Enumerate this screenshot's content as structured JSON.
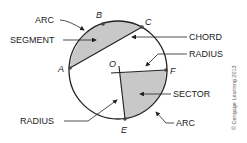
{
  "diagram": {
    "labels": {
      "arc_top": "ARC",
      "segment": "SEGMENT",
      "chord": "CHORD",
      "radius_right": "RADIUS",
      "sector": "SECTOR",
      "radius_left": "RADIUS",
      "arc_bottom": "ARC"
    },
    "points": {
      "A": "A",
      "B": "B",
      "C": "C",
      "O": "O",
      "F": "F",
      "E": "E"
    },
    "credit": "© Cengage Learning 2013",
    "colors": {
      "fill": "#c8c8c8",
      "stroke": "#222222"
    }
  }
}
